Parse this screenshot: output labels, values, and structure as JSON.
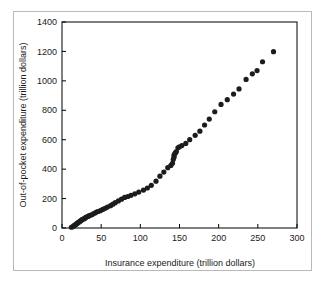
{
  "figure": {
    "background_color": "#ffffff",
    "outer_border_color": "#b9b9b9",
    "axis_color": "#000000",
    "point_color": "#1c1c1c"
  },
  "chart_data": {
    "type": "scatter",
    "title": "",
    "xlabel": "Insurance expenditure (trillion dollars)",
    "ylabel": "Out-of-pocket expenditure (trillion dollars)",
    "xlim": [
      0,
      300
    ],
    "ylim": [
      0,
      1400
    ],
    "xticks": [
      0,
      50,
      100,
      150,
      200,
      250,
      300
    ],
    "yticks": [
      0,
      200,
      400,
      600,
      800,
      1000,
      1200,
      1400
    ],
    "xticklabels": [
      "0",
      "50",
      "100",
      "150",
      "200",
      "250",
      "300"
    ],
    "yticklabels": [
      "0",
      "200",
      "400",
      "600",
      "800",
      "1000",
      "1200",
      "1400"
    ],
    "grid": false,
    "legend": null,
    "marker": "circle",
    "marker_size": 2.6,
    "points": [
      [
        12,
        5
      ],
      [
        14,
        10
      ],
      [
        15,
        14
      ],
      [
        16,
        18
      ],
      [
        17,
        22
      ],
      [
        18,
        26
      ],
      [
        19,
        30
      ],
      [
        20,
        34
      ],
      [
        21,
        38
      ],
      [
        22,
        42
      ],
      [
        23,
        46
      ],
      [
        24,
        50
      ],
      [
        25,
        54
      ],
      [
        26,
        58
      ],
      [
        28,
        62
      ],
      [
        29,
        66
      ],
      [
        30,
        70
      ],
      [
        31,
        74
      ],
      [
        33,
        78
      ],
      [
        34,
        82
      ],
      [
        36,
        86
      ],
      [
        38,
        90
      ],
      [
        40,
        96
      ],
      [
        42,
        102
      ],
      [
        44,
        108
      ],
      [
        46,
        112
      ],
      [
        49,
        118
      ],
      [
        52,
        126
      ],
      [
        55,
        134
      ],
      [
        58,
        142
      ],
      [
        62,
        152
      ],
      [
        65,
        162
      ],
      [
        68,
        172
      ],
      [
        72,
        184
      ],
      [
        76,
        196
      ],
      [
        80,
        208
      ],
      [
        84,
        214
      ],
      [
        88,
        222
      ],
      [
        93,
        232
      ],
      [
        98,
        244
      ],
      [
        104,
        258
      ],
      [
        109,
        272
      ],
      [
        114,
        290
      ],
      [
        120,
        318
      ],
      [
        125,
        352
      ],
      [
        130,
        380
      ],
      [
        135,
        410
      ],
      [
        139,
        425
      ],
      [
        141,
        440
      ],
      [
        142,
        465
      ],
      [
        143,
        480
      ],
      [
        143,
        495
      ],
      [
        144,
        505
      ],
      [
        145,
        512
      ],
      [
        146,
        520
      ],
      [
        148,
        545
      ],
      [
        150,
        552
      ],
      [
        153,
        560
      ],
      [
        158,
        575
      ],
      [
        163,
        600
      ],
      [
        170,
        630
      ],
      [
        176,
        658
      ],
      [
        182,
        700
      ],
      [
        188,
        740
      ],
      [
        195,
        790
      ],
      [
        203,
        840
      ],
      [
        211,
        872
      ],
      [
        219,
        910
      ],
      [
        226,
        945
      ],
      [
        235,
        1010
      ],
      [
        243,
        1048
      ],
      [
        249,
        1070
      ],
      [
        256,
        1130
      ],
      [
        270,
        1198
      ]
    ]
  }
}
